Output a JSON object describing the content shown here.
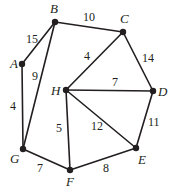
{
  "diagram": {
    "type": "weighted-undirected-graph",
    "nodes": [
      {
        "id": "A",
        "label": "A",
        "x": 22,
        "y": 64,
        "lx": 10,
        "ly": 68
      },
      {
        "id": "B",
        "label": "B",
        "x": 55,
        "y": 22,
        "lx": 50,
        "ly": 13
      },
      {
        "id": "C",
        "label": "C",
        "x": 123,
        "y": 32,
        "lx": 120,
        "ly": 23
      },
      {
        "id": "D",
        "label": "D",
        "x": 153,
        "y": 91,
        "lx": 158,
        "ly": 96
      },
      {
        "id": "E",
        "label": "E",
        "x": 136,
        "y": 148,
        "lx": 138,
        "ly": 164
      },
      {
        "id": "F",
        "label": "F",
        "x": 70,
        "y": 170,
        "lx": 66,
        "ly": 186
      },
      {
        "id": "G",
        "label": "G",
        "x": 23,
        "y": 149,
        "lx": 10,
        "ly": 163
      },
      {
        "id": "H",
        "label": "H",
        "x": 66,
        "y": 90,
        "lx": 51,
        "ly": 95
      }
    ],
    "edges": [
      {
        "from": "A",
        "to": "B",
        "weight": "15",
        "lx": 26,
        "ly": 43
      },
      {
        "from": "B",
        "to": "C",
        "weight": "10",
        "lx": 83,
        "ly": 21
      },
      {
        "from": "B",
        "to": "G",
        "weight": "9",
        "lx": 32,
        "ly": 80
      },
      {
        "from": "A",
        "to": "G",
        "weight": "4",
        "lx": 10,
        "ly": 110
      },
      {
        "from": "C",
        "to": "H",
        "weight": "4",
        "lx": 84,
        "ly": 60
      },
      {
        "from": "C",
        "to": "D",
        "weight": "14",
        "lx": 142,
        "ly": 62
      },
      {
        "from": "H",
        "to": "D",
        "weight": "7",
        "lx": 112,
        "ly": 86
      },
      {
        "from": "H",
        "to": "F",
        "weight": "5",
        "lx": 56,
        "ly": 132
      },
      {
        "from": "H",
        "to": "E",
        "weight": "12",
        "lx": 91,
        "ly": 130
      },
      {
        "from": "D",
        "to": "E",
        "weight": "11",
        "lx": 148,
        "ly": 126
      },
      {
        "from": "G",
        "to": "F",
        "weight": "7",
        "lx": 37,
        "ly": 172
      },
      {
        "from": "F",
        "to": "E",
        "weight": "8",
        "lx": 103,
        "ly": 172
      }
    ]
  }
}
